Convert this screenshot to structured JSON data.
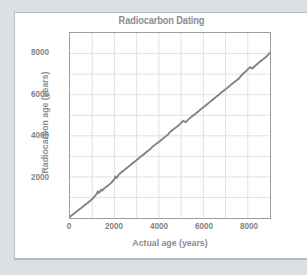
{
  "colors": {
    "page_background": "#dcdfe3",
    "card_background": "#ffffff",
    "text_gray": "#8a8d91",
    "tick_gray": "#7f8286",
    "axis_frame": "#9a9da1",
    "gridline": "#d5dae2",
    "curve": "#808387"
  },
  "chart_data": {
    "type": "line",
    "title": "Radiocarbon Dating",
    "xlabel": "Actual age  (years)",
    "ylabel": "Radiocarbon age  (years)",
    "xlim": [
      0,
      9000
    ],
    "ylim": [
      0,
      9000
    ],
    "xticks": [
      0,
      2000,
      4000,
      6000,
      8000
    ],
    "yticks": [
      2000,
      4000,
      6000,
      8000
    ],
    "xtick_labels": [
      "0",
      "2000",
      "4000",
      "6000",
      "8000"
    ],
    "ytick_labels": [
      "2000",
      "4000",
      "6000",
      "8000"
    ],
    "grid": true,
    "grid_step_x": 1000,
    "grid_step_y": 1000,
    "legend": null,
    "series": [
      {
        "name": "Radiocarbon calibration curve",
        "x": [
          0,
          100,
          200,
          300,
          400,
          500,
          600,
          700,
          800,
          900,
          1000,
          1100,
          1200,
          1250,
          1300,
          1350,
          1400,
          1450,
          1500,
          1600,
          1700,
          1800,
          1900,
          2000,
          2050,
          2100,
          2150,
          2200,
          2300,
          2400,
          2500,
          2600,
          2700,
          2800,
          2900,
          3000,
          3100,
          3200,
          3300,
          3400,
          3500,
          3600,
          3700,
          3800,
          3900,
          4000,
          4100,
          4200,
          4300,
          4400,
          4500,
          4600,
          4700,
          4800,
          4900,
          5000,
          5100,
          5200,
          5300,
          5400,
          5500,
          5600,
          5700,
          5800,
          5900,
          6000,
          6100,
          6200,
          6300,
          6400,
          6500,
          6600,
          6700,
          6800,
          6900,
          7000,
          7100,
          7200,
          7300,
          7400,
          7500,
          7600,
          7700,
          7800,
          7900,
          8000,
          8100,
          8200,
          8300,
          8400,
          8500,
          8600,
          8700,
          8800,
          8900,
          9000
        ],
        "y": [
          60,
          150,
          230,
          320,
          400,
          480,
          570,
          660,
          740,
          830,
          920,
          1040,
          1170,
          1300,
          1220,
          1290,
          1380,
          1330,
          1400,
          1490,
          1570,
          1660,
          1760,
          1900,
          2020,
          1950,
          2040,
          2120,
          2210,
          2300,
          2390,
          2470,
          2560,
          2650,
          2730,
          2820,
          2910,
          3000,
          3080,
          3170,
          3260,
          3340,
          3450,
          3540,
          3620,
          3700,
          3790,
          3880,
          3970,
          4050,
          4180,
          4270,
          4350,
          4430,
          4520,
          4630,
          4730,
          4660,
          4760,
          4860,
          4950,
          5030,
          5120,
          5210,
          5300,
          5390,
          5470,
          5560,
          5650,
          5740,
          5830,
          5910,
          6000,
          6100,
          6180,
          6260,
          6350,
          6440,
          6530,
          6620,
          6700,
          6780,
          6920,
          7030,
          7120,
          7230,
          7340,
          7270,
          7370,
          7470,
          7560,
          7650,
          7730,
          7820,
          7920,
          8050
        ]
      }
    ]
  }
}
